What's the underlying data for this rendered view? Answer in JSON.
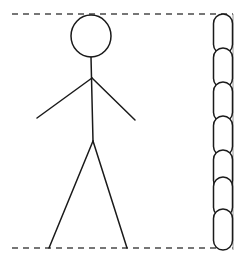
{
  "figure": {
    "background_color": "#ffffff",
    "stroke_color": "#1a1a1a",
    "canvas": {
      "width": 244,
      "height": 263
    },
    "guides": {
      "top_line": {
        "label": "top-reference-dashed-line",
        "x1": 12,
        "y1": 14,
        "x2": 233,
        "y2": 14,
        "style": "dashed",
        "dash": "6 5",
        "stroke_width": 1.6,
        "color": "#4a4a4a"
      },
      "bottom_line": {
        "label": "bottom-reference-dashed-line",
        "x1": 12,
        "y1": 248,
        "x2": 233,
        "y2": 248,
        "style": "dashed",
        "dash": "6 5",
        "stroke_width": 1.6,
        "color": "#4a4a4a"
      },
      "right_edge_line": {
        "label": "right-vertical-guide-line",
        "x1": 233,
        "y1": 14,
        "x2": 233,
        "y2": 250,
        "style": "solid",
        "stroke_width": 0.9,
        "color": "#8a8a8a"
      }
    },
    "stick_figure": {
      "label": "stick-figure",
      "stroke_width": 1.5,
      "color": "#1a1a1a",
      "head": {
        "label": "head-oval",
        "cx": 91,
        "cy": 36,
        "rx": 20,
        "ry": 21
      },
      "spine": {
        "label": "torso-spine-line",
        "x1": 91,
        "y1": 57,
        "x2": 93,
        "y2": 141
      },
      "arm_left": {
        "label": "left-arm-line",
        "x1": 92,
        "y1": 78,
        "x2": 37,
        "y2": 118
      },
      "arm_right": {
        "label": "right-arm-line",
        "x1": 92,
        "y1": 78,
        "x2": 135,
        "y2": 120
      },
      "leg_left": {
        "label": "left-leg-line",
        "x1": 93,
        "y1": 141,
        "x2": 49,
        "y2": 248
      },
      "leg_right": {
        "label": "right-leg-line",
        "x1": 93,
        "y1": 141,
        "x2": 127,
        "y2": 248
      }
    },
    "chain": {
      "label": "vertical-chain-of-links",
      "description": "column of interlocking stadium-shaped chain links measuring the same span as the dashed guides",
      "stroke_width": 1.5,
      "color": "#1a1a1a",
      "link_count": 7,
      "link_width": 19,
      "link_height": 40,
      "link_corner_radius": 9.5,
      "center_x": 223,
      "links": [
        {
          "label": "chain-link-1",
          "x": 213.5,
          "y": 14,
          "width": 19,
          "height": 40
        },
        {
          "label": "chain-link-2",
          "x": 213.5,
          "y": 48,
          "width": 19,
          "height": 40
        },
        {
          "label": "chain-link-3",
          "x": 213.5,
          "y": 82,
          "width": 19,
          "height": 40
        },
        {
          "label": "chain-link-4",
          "x": 213.5,
          "y": 116,
          "width": 19,
          "height": 40
        },
        {
          "label": "chain-link-5",
          "x": 213.5,
          "y": 150,
          "width": 19,
          "height": 40
        },
        {
          "label": "chain-link-6",
          "x": 213.5,
          "y": 177,
          "width": 19,
          "height": 40
        },
        {
          "label": "chain-link-7",
          "x": 213.5,
          "y": 209,
          "width": 19,
          "height": 41
        }
      ]
    }
  }
}
